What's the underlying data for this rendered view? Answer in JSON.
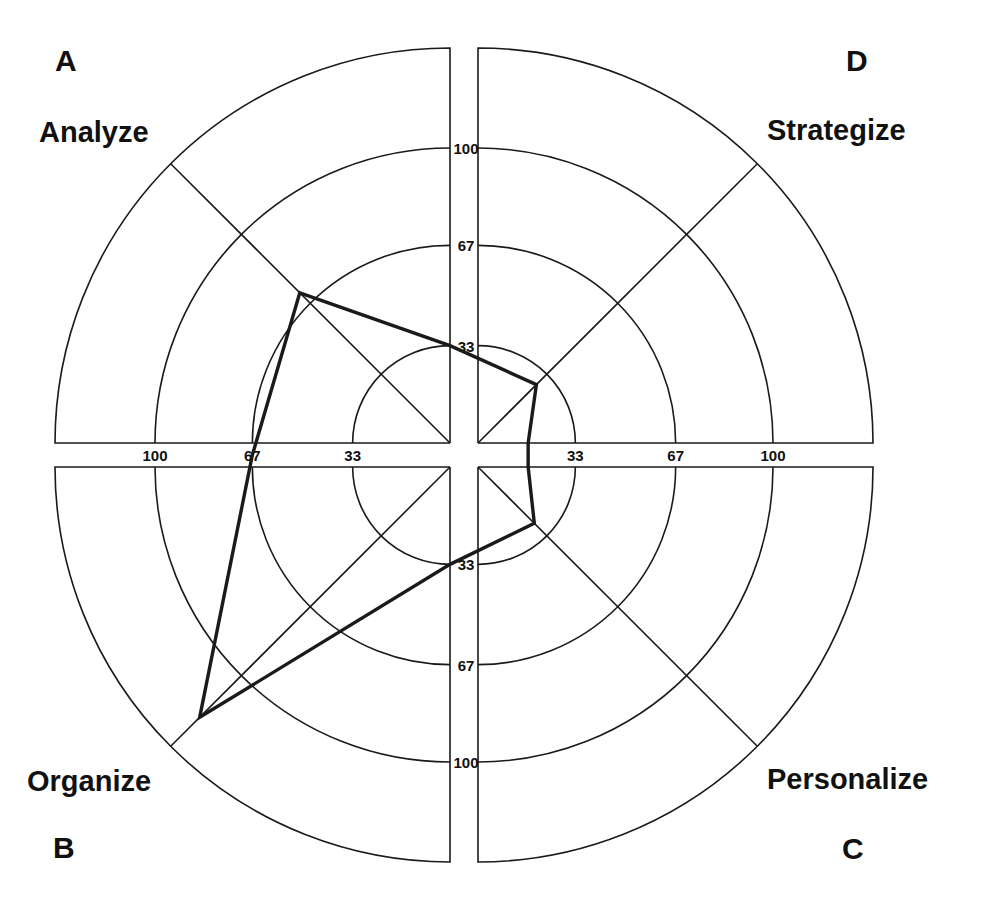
{
  "chart_data": {
    "type": "radar",
    "title": "",
    "rings": [
      33,
      67,
      100
    ],
    "ring_labels": [
      "33",
      "67",
      "100"
    ],
    "quadrants": [
      {
        "id": "A",
        "name": "Analyze",
        "position": "top-left",
        "value": 72
      },
      {
        "id": "D",
        "name": "Strategize",
        "position": "top-right",
        "value": 28
      },
      {
        "id": "C",
        "name": "Personalize",
        "position": "bottom-right",
        "value": 27
      },
      {
        "id": "B",
        "name": "Organize",
        "position": "bottom-left",
        "value": 120
      }
    ],
    "axis_crossings": [
      {
        "axis": "top",
        "value": 33
      },
      {
        "axis": "right",
        "value": 17
      },
      {
        "axis": "bottom",
        "value": 33
      },
      {
        "axis": "left",
        "value": 67
      }
    ],
    "grid": true,
    "legend": "none"
  },
  "labels": {
    "A_letter": "A",
    "A_name": "Analyze",
    "D_letter": "D",
    "D_name": "Strategize",
    "C_letter": "C",
    "C_name": "Personalize",
    "B_letter": "B",
    "B_name": "Organize"
  },
  "tick_labels": {
    "top": [
      "33",
      "67",
      "100"
    ],
    "bottom": [
      "33",
      "67",
      "100"
    ],
    "left": [
      "100",
      "67",
      "33"
    ],
    "right": [
      "33",
      "67",
      "100"
    ]
  },
  "colors": {
    "line": "#1a1a1a",
    "background": "#ffffff"
  }
}
